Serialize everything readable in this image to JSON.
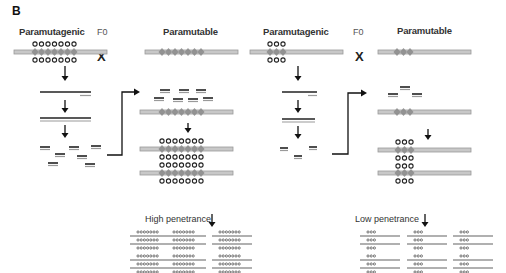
{
  "figure": {
    "panel_label": "B",
    "left": {
      "paramutagenic_label": "Paramutagenic",
      "generation_label": "F0",
      "cross_symbol": "X",
      "paramutable_label": "Paramutable",
      "repeat_count": 7,
      "outcome_label": "High penetrance"
    },
    "right": {
      "paramutagenic_label": "Paramutagenic",
      "generation_label": "F0",
      "cross_symbol": "X",
      "paramutable_label": "Paramutable",
      "repeat_count": 3,
      "outcome_label": "Low penetrance"
    },
    "colors": {
      "chromosome": "#c8c8c8",
      "chromosome_edge": "#9a9a9a",
      "repeat": "#8a8a8a",
      "methylation_circle": "#222222",
      "rna_dark": "#222222",
      "rna_light": "#9a9a9a",
      "arrow": "#111111"
    }
  }
}
